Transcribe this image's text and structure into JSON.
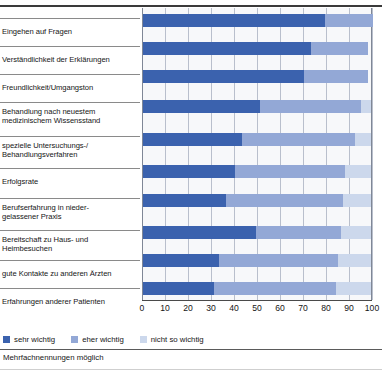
{
  "chart_data": {
    "type": "bar",
    "orientation": "horizontal",
    "stacked": true,
    "title": "",
    "xlabel": "",
    "ylabel": "",
    "xlim": [
      0,
      100
    ],
    "xticks": [
      0,
      10,
      20,
      30,
      40,
      50,
      60,
      70,
      80,
      90,
      100
    ],
    "grid": true,
    "legend_position": "bottom-left",
    "footnote": "Mehrfachnennungen möglich",
    "categories": [
      "Eingehen auf Fragen",
      "Verständlichkeit der Erklärungen",
      "Freundlichkeit/Umgangston",
      "Behandlung nach neuestem medizinischem Wissensstand",
      "spezielle Untersuchungs-/Behandlungsverfahren",
      "Erfolgsrate",
      "Berufserfahrung in niedergelassener Praxis",
      "Bereitschaft zu Haus- und Heimbesuchen",
      "gute Kontakte zu anderen Ärzten",
      "Erfahrungen anderer Patienten"
    ],
    "series": [
      {
        "name": "sehr wichtig",
        "color": "#3b62ae",
        "values": [
          79,
          73,
          70,
          51,
          43,
          40,
          36,
          49,
          33,
          31
        ]
      },
      {
        "name": "eher wichtig",
        "color": "#93a8d6",
        "values": [
          21,
          25,
          28,
          44,
          49,
          48,
          51,
          37,
          52,
          53
        ]
      },
      {
        "name": "nicht so wichtig",
        "color": "#ccd8ec",
        "values": [
          0,
          0,
          0,
          4,
          7,
          11,
          12,
          13,
          14,
          15
        ]
      }
    ]
  },
  "rows": [
    {
      "line1": "Eingehen auf Fragen",
      "line2": ""
    },
    {
      "line1": "Verständlichkeit der Erklärungen",
      "line2": ""
    },
    {
      "line1": "Freundlichkeit/Umgangston",
      "line2": ""
    },
    {
      "line1": "Behandlung nach neuestem",
      "line2": "medizinischem Wissensstand"
    },
    {
      "line1": "spezielle Untersuchungs-/",
      "line2": "Behandlungsverfahren"
    },
    {
      "line1": "Erfolgsrate",
      "line2": ""
    },
    {
      "line1": "Berufserfahrung in nieder-",
      "line2": "gelassener Praxis"
    },
    {
      "line1": "Bereitschaft zu Haus- und",
      "line2": "Heimbesuchen"
    },
    {
      "line1": "gute Kontakte zu anderen Ärzten",
      "line2": ""
    },
    {
      "line1": "Erfahrungen anderer Patienten",
      "line2": ""
    }
  ],
  "axis": {
    "ticks": [
      "0",
      "10",
      "20",
      "30",
      "40",
      "50",
      "60",
      "70",
      "80",
      "90",
      "100"
    ]
  },
  "legend": {
    "items": [
      {
        "label": "sehr wichtig",
        "color": "#3b62ae"
      },
      {
        "label": "eher wichtig",
        "color": "#93a8d6"
      },
      {
        "label": "nicht so wichtig",
        "color": "#ccd8ec"
      }
    ]
  },
  "footnote": {
    "text": "Mehrfachnennungen möglich"
  }
}
